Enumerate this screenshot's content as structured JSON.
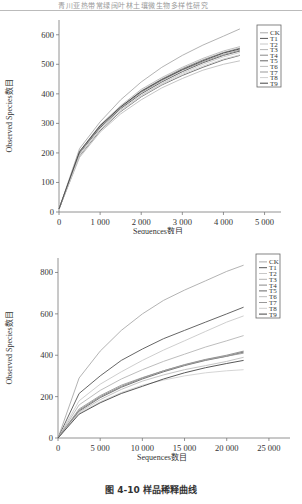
{
  "header": {
    "text": "青川亚热带常绿阔叶林土壤微生物多样性研究"
  },
  "caption": "图 4-10    样品稀释曲线",
  "chart_data": [
    {
      "type": "line",
      "title": "",
      "xlabel": "Sequences数目",
      "ylabel": "Observed Species数目",
      "xlim": [
        0,
        5400
      ],
      "ylim": [
        0,
        650
      ],
      "xticks": [
        0,
        1000,
        2000,
        3000,
        4000,
        5000
      ],
      "xtick_labels": [
        "0",
        "1 000",
        "2 000",
        "3 000",
        "4 000",
        "5 000"
      ],
      "yticks": [
        0,
        100,
        200,
        300,
        400,
        500,
        600
      ],
      "legend": [
        "CK",
        "T1",
        "T2",
        "T3",
        "T4",
        "T5",
        "T6",
        "T7",
        "T8",
        "T9"
      ],
      "legend_position": "upper right",
      "x": [
        0,
        500,
        1000,
        1500,
        2000,
        2500,
        3000,
        3500,
        4000,
        4400
      ],
      "series": [
        {
          "name": "CK",
          "values": [
            10,
            215,
            305,
            380,
            440,
            490,
            530,
            565,
            595,
            620
          ]
        },
        {
          "name": "T1",
          "values": [
            10,
            200,
            285,
            350,
            400,
            440,
            475,
            505,
            530,
            545
          ]
        },
        {
          "name": "T2",
          "values": [
            10,
            195,
            280,
            345,
            395,
            435,
            470,
            500,
            525,
            540
          ]
        },
        {
          "name": "T3",
          "values": [
            10,
            205,
            295,
            360,
            415,
            455,
            490,
            520,
            545,
            560
          ]
        },
        {
          "name": "T4",
          "values": [
            10,
            200,
            290,
            355,
            410,
            450,
            485,
            515,
            540,
            555
          ]
        },
        {
          "name": "T5",
          "values": [
            10,
            190,
            275,
            340,
            390,
            430,
            462,
            490,
            515,
            530
          ]
        },
        {
          "name": "T6",
          "values": [
            10,
            185,
            270,
            332,
            380,
            420,
            452,
            480,
            500,
            512
          ]
        },
        {
          "name": "T7",
          "values": [
            10,
            200,
            288,
            352,
            405,
            445,
            480,
            508,
            533,
            548
          ]
        },
        {
          "name": "T8",
          "values": [
            10,
            192,
            278,
            342,
            392,
            432,
            466,
            494,
            518,
            532
          ]
        },
        {
          "name": "T9",
          "values": [
            10,
            205,
            292,
            356,
            408,
            448,
            482,
            512,
            538,
            552
          ]
        }
      ]
    },
    {
      "type": "line",
      "title": "",
      "xlabel": "Sequences数目",
      "ylabel": "Observed Species数目",
      "xlim": [
        0,
        27500
      ],
      "ylim": [
        0,
        870
      ],
      "xticks": [
        0,
        5000,
        10000,
        15000,
        20000,
        25000
      ],
      "xtick_labels": [
        "0",
        "5 000",
        "10 000",
        "15 000",
        "20 000",
        "25 000"
      ],
      "yticks": [
        0,
        200,
        400,
        600,
        800
      ],
      "legend": [
        "CK",
        "T1",
        "T2",
        "T3",
        "T4",
        "T5",
        "T6",
        "T7",
        "T8",
        "T9"
      ],
      "legend_position": "upper right",
      "x": [
        0,
        2500,
        5000,
        7500,
        10000,
        12500,
        15000,
        17500,
        20000,
        22000
      ],
      "series": [
        {
          "name": "CK",
          "values": [
            0,
            290,
            420,
            520,
            600,
            665,
            715,
            760,
            805,
            835
          ]
        },
        {
          "name": "T1",
          "values": [
            0,
            215,
            300,
            375,
            430,
            480,
            520,
            560,
            600,
            632
          ]
        },
        {
          "name": "T2",
          "values": [
            0,
            180,
            260,
            320,
            375,
            425,
            470,
            515,
            560,
            590
          ]
        },
        {
          "name": "T3",
          "values": [
            0,
            160,
            230,
            285,
            330,
            370,
            405,
            440,
            470,
            495
          ]
        },
        {
          "name": "T4",
          "values": [
            0,
            135,
            200,
            250,
            290,
            325,
            355,
            380,
            400,
            420
          ]
        },
        {
          "name": "T5",
          "values": [
            0,
            130,
            195,
            245,
            285,
            320,
            350,
            375,
            395,
            415
          ]
        },
        {
          "name": "T6",
          "values": [
            0,
            125,
            185,
            235,
            275,
            305,
            330,
            350,
            370,
            390
          ]
        },
        {
          "name": "T7",
          "values": [
            0,
            140,
            205,
            255,
            292,
            325,
            353,
            378,
            396,
            410
          ]
        },
        {
          "name": "T8",
          "values": [
            0,
            120,
            175,
            220,
            255,
            280,
            300,
            315,
            325,
            330
          ]
        },
        {
          "name": "T9",
          "values": [
            0,
            115,
            170,
            215,
            250,
            285,
            315,
            340,
            360,
            375
          ]
        }
      ]
    }
  ],
  "line_colors": [
    "#aaaaaa",
    "#555555",
    "#c8c8c8",
    "#b5b5b5",
    "#888888",
    "#666666",
    "#bdbdbd",
    "#999999",
    "#d0d0d0",
    "#444444"
  ]
}
